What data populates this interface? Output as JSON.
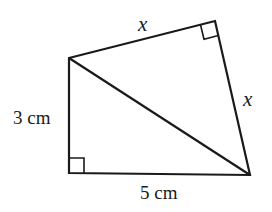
{
  "diagram": {
    "type": "quadrilateral-with-diagonal",
    "vertices": {
      "A": [
        69,
        58
      ],
      "B": [
        215,
        21
      ],
      "C": [
        250,
        175
      ],
      "D": [
        69,
        173
      ]
    },
    "labels": {
      "top_side": "x",
      "right_side": "x",
      "left_side": "3 cm",
      "bottom_side": "5 cm"
    },
    "right_angles": [
      "B",
      "D"
    ],
    "stroke_color": "#1a1a1a"
  }
}
